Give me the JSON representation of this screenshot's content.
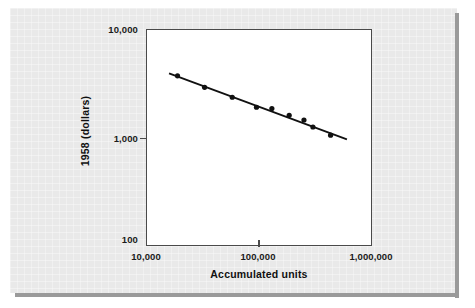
{
  "figure": {
    "background_color": "#e9e9e9",
    "plot_background_color": "#ffffff",
    "frame_color": "#4a4a4a",
    "ink_color": "#111111"
  },
  "chart_data": {
    "type": "scatter",
    "title": "",
    "subtitle": "",
    "xlabel": "Accumulated units",
    "ylabel": "1958 (dollars)",
    "xscale": "log",
    "yscale": "log",
    "xlim": [
      10000,
      1000000
    ],
    "ylim": [
      100,
      10000
    ],
    "grid": false,
    "legend": null,
    "x_tick_labels": [
      "10,000",
      "100,000",
      "1,000,000"
    ],
    "x_tick_values": [
      10000,
      100000,
      1000000
    ],
    "y_tick_labels": [
      "10,000",
      "1,000",
      "100"
    ],
    "y_tick_values": [
      10000,
      1000,
      100
    ],
    "series": [
      {
        "name": "Observed unit cost",
        "marker": "filled-circle",
        "x": [
          19000,
          33000,
          58000,
          95000,
          130000,
          185000,
          250000,
          300000,
          430000
        ],
        "y": [
          3700,
          2900,
          2350,
          1900,
          1850,
          1600,
          1450,
          1250,
          1050
        ]
      }
    ],
    "trend_line": {
      "name": "Fitted learning curve",
      "x_start": 16000,
      "y_start": 3900,
      "x_end": 600000,
      "y_end": 960
    },
    "annotations": []
  },
  "axis": {
    "x_title": "Accumulated units",
    "y_title": "1958 (dollars)",
    "x_ticks": [
      {
        "label": "10,000",
        "value": 10000
      },
      {
        "label": "100,000",
        "value": 100000
      },
      {
        "label": "1,000,000",
        "value": 1000000
      }
    ],
    "y_ticks": [
      {
        "label": "10,000",
        "value": 10000
      },
      {
        "label": "1,000",
        "value": 1000
      },
      {
        "label": "100",
        "value": 100
      }
    ]
  }
}
